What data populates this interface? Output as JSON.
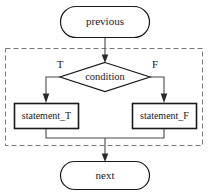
{
  "diagram": {
    "canvas": {
      "width": 209,
      "height": 194,
      "background": "#ffffff"
    },
    "colors": {
      "shape_stroke": "#1a1a1a",
      "connector": "#4a4a4a",
      "group_frame": "#7a7a7a",
      "text": "#1a1a1a",
      "background": "#ffffff"
    },
    "nodes": {
      "previous": {
        "label": "previous",
        "shape": "stadium"
      },
      "condition": {
        "label": "condition",
        "shape": "diamond"
      },
      "statement_true": {
        "label": "statement_T",
        "shape": "rectangle"
      },
      "statement_false": {
        "label": "statement_F",
        "shape": "rectangle"
      },
      "next": {
        "label": "next",
        "shape": "stadium"
      }
    },
    "branch_labels": {
      "true": "T",
      "false": "F"
    },
    "group": {
      "style": "dashed",
      "label": ""
    }
  }
}
